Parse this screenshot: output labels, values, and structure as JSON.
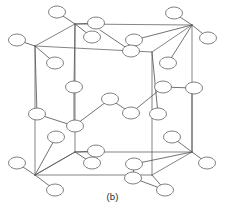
{
  "figure": {
    "caption": "(b)",
    "type": "crystal-lattice-diagram",
    "projection": "oblique",
    "canvas": {
      "width": 225,
      "height": 220
    },
    "colors": {
      "background": "#ffffff",
      "cube_edge": "#6e6e6e",
      "bond": "#585858",
      "atom_stroke": "#6a6a6a",
      "atom_fill": "#ffffff",
      "caption_text": "#2b2b2b"
    },
    "atom": {
      "rx": 8.5,
      "ry": 6.0
    },
    "cube": {
      "front_top_left": [
        35,
        46
      ],
      "front_top_right": [
        152,
        52
      ],
      "front_bottom_left": [
        35,
        175
      ],
      "front_bottom_right": [
        152,
        175
      ],
      "back_top_left": [
        75,
        24
      ],
      "back_top_right": [
        192,
        25
      ],
      "back_bottom_left": [
        75,
        152
      ],
      "back_bottom_right": [
        192,
        152
      ],
      "edges": [
        [
          "front_top_left",
          "front_top_right"
        ],
        [
          "front_top_right",
          "front_bottom_right"
        ],
        [
          "front_bottom_right",
          "front_bottom_left"
        ],
        [
          "front_bottom_left",
          "front_top_left"
        ],
        [
          "back_top_left",
          "back_top_right"
        ],
        [
          "back_top_right",
          "back_bottom_right"
        ],
        [
          "back_bottom_right",
          "back_bottom_left"
        ],
        [
          "back_bottom_left",
          "back_top_left"
        ],
        [
          "front_top_left",
          "back_top_left"
        ],
        [
          "front_top_right",
          "back_top_right"
        ],
        [
          "front_bottom_left",
          "back_bottom_left"
        ],
        [
          "front_bottom_right",
          "back_bottom_right"
        ]
      ]
    },
    "atoms": [
      {
        "id": "a01",
        "cx": 57,
        "cy": 12,
        "role": "outer-top-left"
      },
      {
        "id": "a02",
        "cx": 96,
        "cy": 23,
        "role": "upper-back-cluster"
      },
      {
        "id": "a03",
        "cx": 92,
        "cy": 37,
        "role": "upper-back-cluster"
      },
      {
        "id": "a04",
        "cx": 174,
        "cy": 13,
        "role": "outer-top-right"
      },
      {
        "id": "a05",
        "cx": 208,
        "cy": 38,
        "role": "outer-right-top"
      },
      {
        "id": "a06",
        "cx": 17,
        "cy": 40,
        "role": "outer-left-top"
      },
      {
        "id": "a07",
        "cx": 55,
        "cy": 63,
        "role": "front-top-left-bond"
      },
      {
        "id": "a08",
        "cx": 134,
        "cy": 40,
        "role": "top-face-center-upper"
      },
      {
        "id": "a09",
        "cx": 131,
        "cy": 51,
        "role": "top-face-center-lower"
      },
      {
        "id": "a10",
        "cx": 168,
        "cy": 63,
        "role": "back-top-right-bond"
      },
      {
        "id": "a11",
        "cx": 74,
        "cy": 87,
        "role": "interior-upper-left"
      },
      {
        "id": "a12",
        "cx": 163,
        "cy": 87,
        "role": "interior-upper-right"
      },
      {
        "id": "a13",
        "cx": 194,
        "cy": 88,
        "role": "right-edge-mid"
      },
      {
        "id": "a14",
        "cx": 110,
        "cy": 99,
        "role": "interior-center-upper"
      },
      {
        "id": "a15",
        "cx": 131,
        "cy": 113,
        "role": "interior-center-lower"
      },
      {
        "id": "a16",
        "cx": 37,
        "cy": 114,
        "role": "front-left-edge-mid"
      },
      {
        "id": "a17",
        "cx": 158,
        "cy": 114,
        "role": "front-right-edge-mid"
      },
      {
        "id": "a18",
        "cx": 75,
        "cy": 126,
        "role": "interior-lower-left"
      },
      {
        "id": "a19",
        "cx": 56,
        "cy": 137,
        "role": "lower-left-bond"
      },
      {
        "id": "a20",
        "cx": 172,
        "cy": 137,
        "role": "lower-right-bond"
      },
      {
        "id": "a21",
        "cx": 96,
        "cy": 151,
        "role": "bottom-back-cluster"
      },
      {
        "id": "a22",
        "cx": 92,
        "cy": 163,
        "role": "bottom-back-cluster"
      },
      {
        "id": "a23",
        "cx": 17,
        "cy": 163,
        "role": "outer-left-bottom"
      },
      {
        "id": "a24",
        "cx": 207,
        "cy": 163,
        "role": "outer-right-bottom"
      },
      {
        "id": "a25",
        "cx": 134,
        "cy": 164,
        "role": "bottom-face-center-upper"
      },
      {
        "id": "a26",
        "cx": 133,
        "cy": 178,
        "role": "bottom-face-center-lower"
      },
      {
        "id": "a27",
        "cx": 55,
        "cy": 190,
        "role": "outer-bottom-left"
      },
      {
        "id": "a28",
        "cx": 165,
        "cy": 190,
        "role": "outer-bottom-right"
      }
    ],
    "bonds": [
      {
        "from": [
          75,
          24
        ],
        "to": [
          57,
          12
        ]
      },
      {
        "from": [
          75,
          24
        ],
        "to": [
          96,
          23
        ]
      },
      {
        "from": [
          75,
          24
        ],
        "to": [
          92,
          37
        ]
      },
      {
        "from": [
          192,
          25
        ],
        "to": [
          174,
          13
        ]
      },
      {
        "from": [
          192,
          25
        ],
        "to": [
          208,
          38
        ]
      },
      {
        "from": [
          35,
          46
        ],
        "to": [
          17,
          40
        ]
      },
      {
        "from": [
          35,
          46
        ],
        "to": [
          55,
          63
        ]
      },
      {
        "from": [
          192,
          25
        ],
        "to": [
          134,
          40
        ]
      },
      {
        "from": [
          134,
          40
        ],
        "to": [
          131,
          51
        ]
      },
      {
        "from": [
          131,
          51
        ],
        "to": [
          100,
          30
        ]
      },
      {
        "from": [
          192,
          25
        ],
        "to": [
          168,
          63
        ]
      },
      {
        "from": [
          75,
          24
        ],
        "to": [
          74,
          87
        ]
      },
      {
        "from": [
          74,
          87
        ],
        "to": [
          74,
          126
        ]
      },
      {
        "from": [
          74,
          126
        ],
        "to": [
          110,
          99
        ]
      },
      {
        "from": [
          110,
          99
        ],
        "to": [
          131,
          113
        ]
      },
      {
        "from": [
          131,
          113
        ],
        "to": [
          163,
          87
        ]
      },
      {
        "from": [
          163,
          87
        ],
        "to": [
          192,
          88
        ]
      },
      {
        "from": [
          152,
          52
        ],
        "to": [
          158,
          114
        ]
      },
      {
        "from": [
          35,
          46
        ],
        "to": [
          37,
          114
        ]
      },
      {
        "from": [
          37,
          114
        ],
        "to": [
          74,
          126
        ]
      },
      {
        "from": [
          35,
          175
        ],
        "to": [
          56,
          137
        ]
      },
      {
        "from": [
          35,
          175
        ],
        "to": [
          17,
          163
        ]
      },
      {
        "from": [
          35,
          175
        ],
        "to": [
          55,
          190
        ]
      },
      {
        "from": [
          75,
          152
        ],
        "to": [
          96,
          151
        ]
      },
      {
        "from": [
          75,
          152
        ],
        "to": [
          92,
          163
        ]
      },
      {
        "from": [
          75,
          152
        ],
        "to": [
          35,
          175
        ]
      },
      {
        "from": [
          192,
          152
        ],
        "to": [
          172,
          137
        ]
      },
      {
        "from": [
          192,
          152
        ],
        "to": [
          207,
          163
        ]
      },
      {
        "from": [
          192,
          152
        ],
        "to": [
          134,
          164
        ]
      },
      {
        "from": [
          134,
          164
        ],
        "to": [
          133,
          178
        ]
      },
      {
        "from": [
          133,
          178
        ],
        "to": [
          165,
          190
        ]
      },
      {
        "from": [
          152,
          175
        ],
        "to": [
          165,
          190
        ]
      },
      {
        "from": [
          192,
          152
        ],
        "to": [
          192,
          88
        ]
      }
    ]
  }
}
